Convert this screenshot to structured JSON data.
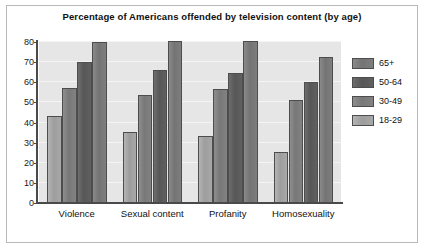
{
  "chart_data": {
    "type": "bar",
    "title": "Percentage of Americans offended by television content (by age)",
    "xlabel": "",
    "ylabel": "",
    "ylim": [
      0,
      80
    ],
    "yticks": [
      0,
      10,
      20,
      30,
      40,
      50,
      60,
      70,
      80
    ],
    "ytick_labels": [
      "0",
      "10",
      "20",
      "30",
      "40",
      "50",
      "60",
      "70",
      "80"
    ],
    "grid": true,
    "legend_position": "right",
    "categories": [
      "Violence",
      "Sexual content",
      "Profanity",
      "Homosexuality"
    ],
    "series": [
      {
        "name": "18-29",
        "color": "#9d9d9d",
        "values": [
          43,
          35.5,
          33.5,
          25.5
        ]
      },
      {
        "name": "30-49",
        "color": "#787878",
        "values": [
          57,
          53.5,
          56.5,
          51
        ]
      },
      {
        "name": "50-64",
        "color": "#575757",
        "values": [
          70,
          66,
          64.5,
          60
        ]
      },
      {
        "name": "65+",
        "color": "#747474",
        "values": [
          80,
          80.5,
          80.5,
          72.5
        ]
      }
    ],
    "legend_order": [
      "65+",
      "50-64",
      "30-49",
      "18-29"
    ]
  },
  "legend": {
    "items": [
      {
        "label": "65+"
      },
      {
        "label": "50-64"
      },
      {
        "label": "30-49"
      },
      {
        "label": "18-29"
      }
    ]
  },
  "axis": {
    "y_labels": [
      "80",
      "70",
      "60",
      "50",
      "40",
      "30",
      "20",
      "10",
      "0"
    ]
  }
}
